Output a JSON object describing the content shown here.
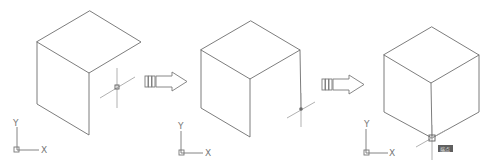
{
  "diagram": {
    "line_color": "#6e6e6e",
    "crosshair_color": "#a8a8a8",
    "steps": [
      {
        "id": "step-1",
        "cube": {
          "top": [
            90,
            11
          ],
          "left": [
            37,
            42
          ],
          "right": [
            141,
            42
          ],
          "front": [
            89,
            73
          ],
          "left_bottom": [
            37,
            104
          ],
          "front_bottom": [
            89,
            135
          ],
          "right_bottom": null
        },
        "crosshair": {
          "center": [
            117,
            87
          ],
          "snap_marker": "square"
        },
        "ucs": {
          "origin": [
            18,
            147
          ],
          "x_label": "X",
          "y_label": "Y"
        }
      },
      {
        "id": "step-2",
        "cube": {
          "top": [
            251,
            21
          ],
          "left": [
            201,
            50
          ],
          "right": [
            300,
            50
          ],
          "front": [
            250,
            79
          ],
          "left_bottom": [
            201,
            108
          ],
          "front_bottom": [
            250,
            137
          ],
          "right_bottom": [
            301,
            109
          ]
        },
        "crosshair": {
          "center": [
            301,
            109
          ],
          "snap_marker": "dot"
        },
        "ucs": {
          "origin": [
            181,
            152
          ],
          "x_label": "X",
          "y_label": "Y"
        }
      },
      {
        "id": "step-3",
        "cube": {
          "top": [
            432,
            27
          ],
          "left": [
            384,
            55
          ],
          "right": [
            479,
            55
          ],
          "front": [
            431,
            83
          ],
          "left_bottom": [
            384,
            112
          ],
          "front_bottom": [
            432,
            138
          ],
          "right_bottom": [
            479,
            112
          ]
        },
        "crosshair": {
          "center": [
            432,
            138
          ],
          "snap_marker": "square"
        },
        "snap_tooltip": {
          "label": "端点"
        },
        "ucs": {
          "origin": [
            366,
            153
          ],
          "x_label": "X",
          "y_label": "Y"
        }
      }
    ],
    "arrows": [
      {
        "id": "arrow-1",
        "direction": "right"
      },
      {
        "id": "arrow-2",
        "direction": "right"
      }
    ]
  }
}
